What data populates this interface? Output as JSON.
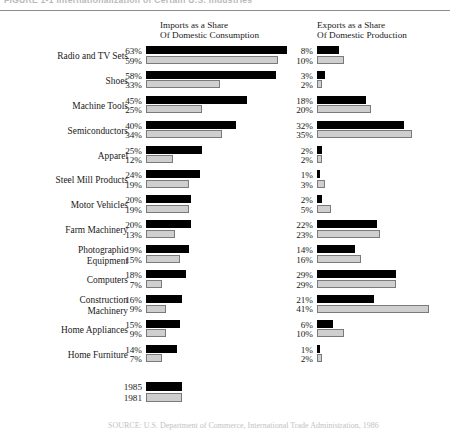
{
  "figure": {
    "caption": "FIGURE 1-1   Internationalization of Certain U.S. Industries",
    "source_note": "SOURCE: U.S. Department of Commerce, International Trade Administration, 1986"
  },
  "headings": {
    "imports": "Imports as a Share\nOf Domestic Consumption",
    "exports": "Exports as a Share\nOf Domestic Production"
  },
  "legend": {
    "items": [
      {
        "label": "1985",
        "color": "#000000"
      },
      {
        "label": "1981",
        "color": "#cfcfcf"
      }
    ]
  },
  "chart_data": {
    "type": "bar",
    "title": "FIGURE 1-1   Internationalization of Certain U.S. Industries",
    "orientation": "horizontal",
    "panels": [
      {
        "name": "imports",
        "title": "Imports as a Share Of Domestic Consumption",
        "unit": "%",
        "xlim": [
          0,
          63
        ]
      },
      {
        "name": "exports",
        "title": "Exports as a Share Of Domestic Production",
        "unit": "%",
        "xlim": [
          0,
          41
        ]
      }
    ],
    "series": [
      {
        "name": "1985",
        "color": "#000000"
      },
      {
        "name": "1981",
        "color": "#cfcfcf"
      }
    ],
    "categories": [
      "Radio and TV Sets",
      "Shoes",
      "Machine Tools",
      "Semiconductors",
      "Apparel",
      "Steel Mill Products",
      "Motor Vehicles",
      "Farm Machinery",
      "Photographic Equipment",
      "Computers",
      "Construction Machinery",
      "Home Appliances",
      "Home Furniture"
    ],
    "imports": {
      "1985": [
        63,
        58,
        45,
        40,
        25,
        24,
        20,
        20,
        19,
        18,
        16,
        15,
        14
      ],
      "1981": [
        59,
        33,
        25,
        34,
        12,
        19,
        19,
        13,
        15,
        7,
        9,
        9,
        7
      ]
    },
    "exports": {
      "1985": [
        8,
        3,
        18,
        32,
        2,
        1,
        2,
        22,
        14,
        29,
        21,
        6,
        1
      ],
      "1981": [
        10,
        2,
        20,
        35,
        2,
        3,
        5,
        23,
        16,
        29,
        41,
        10,
        2
      ]
    },
    "xlabel": "",
    "ylabel": "",
    "grid": false,
    "legend_position": "bottom-left"
  },
  "rows": [
    {
      "label": "Radio and TV Sets",
      "lines": 1,
      "imp85": "63%",
      "imp81": "59%",
      "exp85": "8%",
      "exp81": "10%"
    },
    {
      "label": "Shoes",
      "lines": 1,
      "imp85": "58%",
      "imp81": "33%",
      "exp85": "3%",
      "exp81": "2%"
    },
    {
      "label": "Machine Tools",
      "lines": 1,
      "imp85": "45%",
      "imp81": "25%",
      "exp85": "18%",
      "exp81": "20%"
    },
    {
      "label": "Semiconductors",
      "lines": 1,
      "imp85": "40%",
      "imp81": "34%",
      "exp85": "32%",
      "exp81": "35%"
    },
    {
      "label": "Apparel",
      "lines": 1,
      "imp85": "25%",
      "imp81": "12%",
      "exp85": "2%",
      "exp81": "2%"
    },
    {
      "label": "Steel Mill Products",
      "lines": 1,
      "imp85": "24%",
      "imp81": "19%",
      "exp85": "1%",
      "exp81": "3%"
    },
    {
      "label": "Motor Vehicles",
      "lines": 1,
      "imp85": "20%",
      "imp81": "19%",
      "exp85": "2%",
      "exp81": "5%"
    },
    {
      "label": "Farm Machinery",
      "lines": 1,
      "imp85": "20%",
      "imp81": "13%",
      "exp85": "22%",
      "exp81": "23%"
    },
    {
      "label": "Photographic\nEquipment",
      "lines": 2,
      "imp85": "19%",
      "imp81": "15%",
      "exp85": "14%",
      "exp81": "16%"
    },
    {
      "label": "Computers",
      "lines": 1,
      "imp85": "18%",
      "imp81": "7%",
      "exp85": "29%",
      "exp81": "29%"
    },
    {
      "label": "Construction\nMachinery",
      "lines": 2,
      "imp85": "16%",
      "imp81": "9%",
      "exp85": "21%",
      "exp81": "41%"
    },
    {
      "label": "Home Appliances",
      "lines": 1,
      "imp85": "15%",
      "imp81": "9%",
      "exp85": "6%",
      "exp81": "10%"
    },
    {
      "label": "Home Furniture",
      "lines": 1,
      "imp85": "14%",
      "imp81": "7%",
      "exp85": "1%",
      "exp81": "2%"
    }
  ]
}
